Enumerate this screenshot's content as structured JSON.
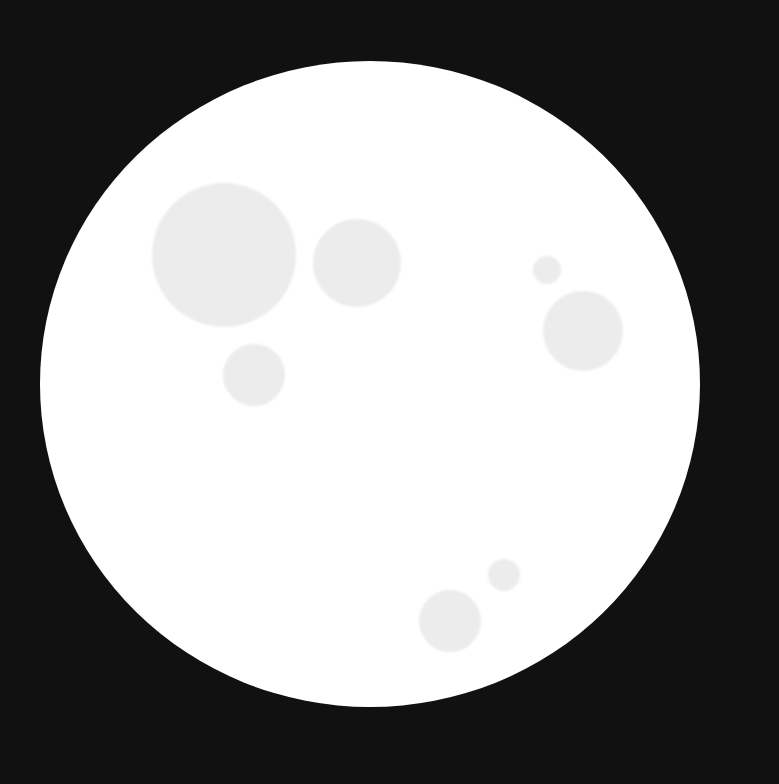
{
  "scene": {
    "description": "White disc with scattered light-gray circular spots on a black background",
    "background_color": "#111111",
    "disc": {
      "cx": 370,
      "cy": 384,
      "rx": 330,
      "ry": 323,
      "color": "#ffffff"
    },
    "spot_color": "#ececec",
    "spots": [
      {
        "cx": 224,
        "cy": 255,
        "r": 72
      },
      {
        "cx": 357,
        "cy": 263,
        "r": 44
      },
      {
        "cx": 254,
        "cy": 375,
        "r": 31
      },
      {
        "cx": 547,
        "cy": 270,
        "r": 14
      },
      {
        "cx": 583,
        "cy": 331,
        "r": 40
      },
      {
        "cx": 504,
        "cy": 575,
        "r": 16
      },
      {
        "cx": 450,
        "cy": 621,
        "r": 31
      }
    ]
  }
}
